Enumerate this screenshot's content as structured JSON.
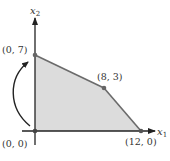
{
  "diagram": {
    "type": "feasible-region",
    "axes": {
      "x_label": "x",
      "x_sub": "1",
      "y_label": "x",
      "y_sub": "2"
    },
    "vertices": [
      {
        "label": "(0, 0)",
        "x": 0,
        "y": 0
      },
      {
        "label": "(12, 0)",
        "x": 12,
        "y": 0
      },
      {
        "label": "(8, 3)",
        "x": 8,
        "y": 3
      },
      {
        "label": "(0, 7)",
        "x": 0,
        "y": 7
      }
    ],
    "region_fill": "#dcdcdc",
    "edge_color": "#6b6b6b",
    "axis_color": "#222222",
    "annotation": "curved arrow from (0, 0) to (0, 7)"
  }
}
